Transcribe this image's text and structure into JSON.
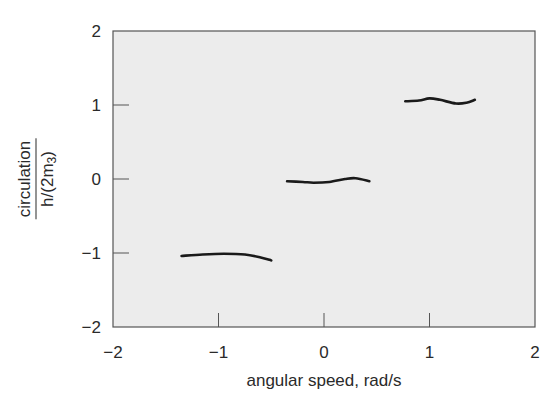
{
  "chart_data": {
    "type": "line",
    "title": "",
    "xlabel": "angular speed, rad/s",
    "ylabel": {
      "numerator": "circulation",
      "denominator_prefix": "h/(2m",
      "denominator_sub": "3",
      "denominator_suffix": ")"
    },
    "xlim": [
      -2,
      2
    ],
    "ylim": [
      -2,
      2
    ],
    "xticks": [
      -2,
      -1,
      0,
      1,
      2
    ],
    "xtick_labels": [
      "−2",
      "−1",
      "0",
      "1",
      "2"
    ],
    "yticks": [
      -2,
      -1,
      0,
      1,
      2
    ],
    "ytick_labels": [
      "−2",
      "−1",
      "0",
      "1",
      "2"
    ],
    "grid": false,
    "legend": null,
    "background": "#ececec",
    "line_color": "#1a1a1a",
    "series": [
      {
        "name": "plateau -1",
        "x": [
          -1.35,
          -1.15,
          -0.95,
          -0.75,
          -0.6,
          -0.5
        ],
        "y": [
          -1.04,
          -1.02,
          -1.01,
          -1.02,
          -1.06,
          -1.1
        ]
      },
      {
        "name": "plateau 0",
        "x": [
          -0.35,
          -0.2,
          -0.1,
          0.05,
          0.2,
          0.3,
          0.43
        ],
        "y": [
          -0.03,
          -0.04,
          -0.05,
          -0.04,
          0.0,
          0.01,
          -0.03
        ]
      },
      {
        "name": "plateau 1",
        "x": [
          0.77,
          0.9,
          1.0,
          1.1,
          1.25,
          1.35,
          1.43
        ],
        "y": [
          1.05,
          1.06,
          1.09,
          1.07,
          1.02,
          1.03,
          1.07
        ]
      }
    ]
  }
}
